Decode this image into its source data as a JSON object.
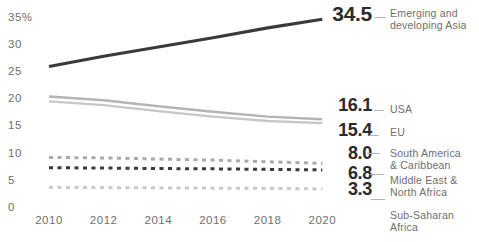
{
  "chart_data": {
    "type": "line",
    "x": [
      2010,
      2012,
      2014,
      2016,
      2018,
      2020
    ],
    "x_tick_labels": [
      "2010",
      "2012",
      "2014",
      "2016",
      "2018",
      "2020"
    ],
    "y_ticks": [
      {
        "label": "35%",
        "value": 35
      },
      {
        "label": "30",
        "value": 30
      },
      {
        "label": "25",
        "value": 25
      },
      {
        "label": "20",
        "value": 20
      },
      {
        "label": "15",
        "value": 15
      },
      {
        "label": "10",
        "value": 10
      },
      {
        "label": "5",
        "value": 5
      },
      {
        "label": "0",
        "value": 0
      }
    ],
    "xlim": [
      2010,
      2020
    ],
    "ylim": [
      0,
      35
    ],
    "y_unit": "%",
    "grid": false,
    "legend_position": "right",
    "series": [
      {
        "name": "Emerging and developing Asia",
        "label_display": "Emerging and\ndeveloping Asia",
        "end_label": "34.5",
        "values": [
          25.8,
          27.7,
          29.4,
          31.1,
          32.9,
          34.5
        ],
        "color": "#3a3a3a",
        "style": "solid",
        "width": 3.2
      },
      {
        "name": "USA",
        "label_display": "USA",
        "end_label": "16.1",
        "values": [
          20.3,
          19.6,
          18.5,
          17.5,
          16.6,
          16.1
        ],
        "color": "#b4b4b4",
        "style": "solid",
        "width": 2.4
      },
      {
        "name": "EU",
        "label_display": "EU",
        "end_label": "15.4",
        "values": [
          19.4,
          18.7,
          17.6,
          16.6,
          15.8,
          15.4
        ],
        "color": "#c7c7c7",
        "style": "solid",
        "width": 2.4
      },
      {
        "name": "South America & Caribbean",
        "label_display": "South America\n& Caribbean",
        "end_label": "8.0",
        "values": [
          9.1,
          9.0,
          8.8,
          8.6,
          8.3,
          8.0
        ],
        "color": "#a9a9a9",
        "style": "dashed",
        "width": 3
      },
      {
        "name": "Middle East & North Africa",
        "label_display": "Middle East &\nNorth Africa",
        "end_label": "6.8",
        "values": [
          7.2,
          7.15,
          7.05,
          7.0,
          6.9,
          6.8
        ],
        "color": "#3a3a3a",
        "style": "dashed",
        "width": 3
      },
      {
        "name": "Sub-Saharan Africa",
        "label_display": "Sub-Saharan\nAfrica",
        "end_label": "3.3",
        "values": [
          3.6,
          3.55,
          3.5,
          3.45,
          3.4,
          3.3
        ],
        "color": "#c9c9c9",
        "style": "dashed",
        "width": 3
      }
    ]
  },
  "colors": {
    "background": "#ffffff",
    "number_text": "#2b2b2b",
    "label_text": "#6e6e6e",
    "axis_text": "#6f6f6f",
    "connector": "#b3b3b3"
  }
}
